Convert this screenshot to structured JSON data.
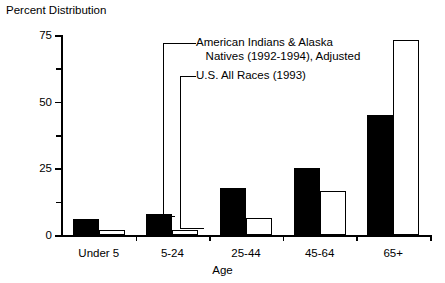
{
  "chart_data": {
    "type": "bar",
    "title": "Percent Distribution",
    "xlabel": "Age",
    "ylabel": "Percent Distribution",
    "categories": [
      "Under 5",
      "5-24",
      "25-44",
      "45-64",
      "65+"
    ],
    "series": [
      {
        "name": "American Indians & Alaska Natives (1992-1994), Adjusted",
        "style": "filled",
        "values": [
          6,
          8,
          17.5,
          25,
          45
        ]
      },
      {
        "name": "U.S. All Races (1993)",
        "style": "hollow",
        "values": [
          2,
          2,
          6.5,
          16.5,
          73
        ]
      }
    ],
    "ylim": [
      0,
      75
    ],
    "y_ticks_major": [
      0,
      25,
      50,
      75
    ],
    "y_tick_labels": [
      "0",
      "25",
      "50",
      "75"
    ],
    "y_ticks_minor": [
      12.5,
      37.5,
      62.5
    ],
    "grid": false,
    "legend": "annotated-callouts",
    "annotations": [
      {
        "id": "annot-natives",
        "line1": "American Indians & Alaska",
        "line2": "   Natives (1992-1994), Adjusted",
        "target_category": "5-24",
        "target_series": "American Indians & Alaska Natives (1992-1994), Adjusted"
      },
      {
        "id": "annot-all-races",
        "line1": "U.S. All Races (1993)",
        "target_category": "5-24",
        "target_series": "U.S. All Races (1993)"
      }
    ]
  },
  "colors": {
    "axis": "#000000",
    "filled_bar": "#000000",
    "hollow_bar": "#ffffff",
    "background": "#ffffff"
  }
}
